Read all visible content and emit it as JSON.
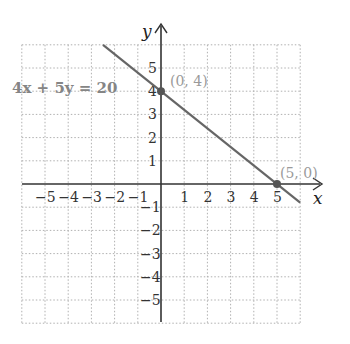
{
  "chart_data": {
    "type": "line",
    "title": "",
    "xlabel": "x",
    "ylabel": "y",
    "xlim": [
      -6,
      6
    ],
    "ylim": [
      -6,
      6
    ],
    "grid": true,
    "x_ticks": [
      -5,
      -4,
      -3,
      -2,
      -1,
      1,
      2,
      3,
      4,
      5
    ],
    "y_ticks": [
      5,
      4,
      3,
      2,
      1,
      -1,
      -2,
      -3,
      -4,
      -5
    ],
    "x_tick_labels": [
      "−5",
      "−4",
      "−3",
      "−2",
      "−1",
      "1",
      "2",
      "3",
      "4",
      "5"
    ],
    "y_tick_labels": [
      "5",
      "4",
      "3",
      "2",
      "1",
      "−1",
      "−2",
      "−3",
      "−4",
      "−5"
    ],
    "series": [
      {
        "name": "4x + 5y = 20",
        "equation": "4x + 5y = 20",
        "x": [
          -2.5,
          6
        ],
        "y": [
          6,
          -0.8
        ],
        "color": "#666666"
      }
    ],
    "points": [
      {
        "x": 0,
        "y": 4,
        "label": "(0, 4)"
      },
      {
        "x": 5,
        "y": 0,
        "label": "(5, 0)"
      }
    ],
    "annotations": [
      {
        "text": "4x + 5y = 20",
        "position": "left of y-axis near y=4"
      }
    ]
  },
  "labels": {
    "x_axis": "x",
    "y_axis": "y",
    "equation": "4x + 5y = 20",
    "point_a": "(0, 4)",
    "point_b": "(5, 0)"
  },
  "colors": {
    "line": "#666666",
    "point": "#555555",
    "grid": "#b0b0b0",
    "axis": "#333333",
    "equation_label": "#858585",
    "point_label": "#9a9a9a"
  }
}
